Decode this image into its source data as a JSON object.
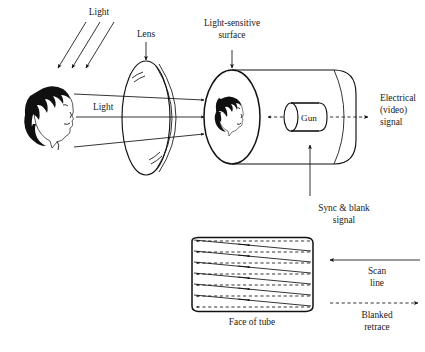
{
  "figure": {
    "background_color": "#ffffff",
    "ink_color": "#111111"
  },
  "labels": {
    "light_top": "Light",
    "light_mid": "Light",
    "lens": "Lens",
    "light_sensitive_surface": "Light-sensitive\nsurface",
    "light_sensitive_surface_line1": "Light-sensitive",
    "light_sensitive_surface_line2": "surface",
    "gun": "Gun",
    "electrical_signal_line1": "Electrical",
    "electrical_signal_line2": "(video)",
    "electrical_signal_line3": "signal",
    "sync_blank_line1": "Sync & blank",
    "sync_blank_line2": "signal",
    "face_of_tube": "Face of tube",
    "scan_line_1": "Scan",
    "scan_line_2": "line",
    "blanked_retrace_1": "Blanked",
    "blanked_retrace_2": "retrace"
  },
  "scan_diagram": {
    "solid_line_count": 6,
    "dashed_line_count": 7,
    "solid_arrow_direction": "right",
    "dashed_arrow_direction": "left",
    "legend": {
      "scan_line_style": "solid",
      "scan_line_arrow_direction": "left",
      "retrace_style": "dashed",
      "retrace_arrow_direction": "right"
    }
  },
  "components": {
    "subject": "woman-head-profile",
    "lens": "double-outline-ellipse",
    "tube": "horizontal-cylinder",
    "tube_face": "large-ellipse-with-image",
    "gun": "small-capsule-cylinder",
    "raster": "rounded-rectangle-screen"
  },
  "rays": {
    "incident_light_arrows": 3,
    "image_rays": 3
  }
}
